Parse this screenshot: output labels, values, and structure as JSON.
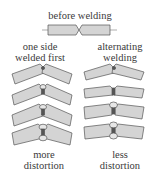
{
  "title": "before welding",
  "left_column": {
    "label_line1": "one side",
    "label_line2": "welded first",
    "caption_line1": "more",
    "caption_line2": "distortion"
  },
  "right_column": {
    "label_line1": "alternating",
    "label_line2": "welding",
    "caption_line1": "less",
    "caption_line2": "distortion"
  },
  "colors": {
    "plate_fill": "#d4d4d4",
    "plate_stroke": "#555555",
    "weld_fill": "#e6e6e6"
  }
}
